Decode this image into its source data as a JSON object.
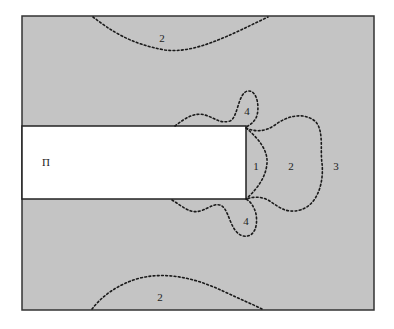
{
  "diagram": {
    "type": "zone-contour-map",
    "colors": {
      "background": "#ffffff",
      "field_fill": "#c4c4c4",
      "frame_stroke": "#333333",
      "excavation_fill": "#ffffff",
      "contour_stroke": "#1a1a1a",
      "label_color": "#222222"
    },
    "frame": {
      "x": 22,
      "y": 16,
      "width": 352,
      "height": 294
    },
    "excavation": {
      "label": "П",
      "x": 22,
      "y": 126,
      "width": 224,
      "height": 73,
      "label_pos": {
        "x": 46,
        "y": 166
      }
    },
    "zones": [
      {
        "id": "zone-2-top",
        "label": "2",
        "label_pos": {
          "x": 162,
          "y": 42
        },
        "path": "M93,17 C110,30 130,44 165,50 C195,54 230,35 268,17"
      },
      {
        "id": "zone-4-upper",
        "label": "4",
        "label_pos": {
          "x": 247,
          "y": 115
        },
        "path": "M175,126 C185,118 195,112 205,115 C215,118 220,124 230,121 C238,118 238,92 248,91 C258,90 260,110 256,118 C253,123 250,125 246,127"
      },
      {
        "id": "zone-1",
        "label": "1",
        "label_pos": {
          "x": 256,
          "y": 170
        },
        "path": "M246,128 C258,138 268,150 267,163 C266,178 256,190 246,199"
      },
      {
        "id": "zone-2-right",
        "label": "2",
        "label_pos": {
          "x": 291,
          "y": 170
        },
        "path": "M246,128 C255,132 265,132 275,125 C288,115 305,112 316,122 C324,132 320,150 322,163 C324,182 318,205 300,210 C285,214 278,206 268,200 C260,196 252,197 246,199"
      },
      {
        "id": "zone-4-lower",
        "label": "4",
        "label_pos": {
          "x": 246,
          "y": 225
        },
        "path": "M172,200 C182,206 190,214 200,211 C210,208 215,202 222,206 C230,212 230,232 243,236 C255,238 258,225 256,214 C254,206 250,201 246,199"
      },
      {
        "id": "zone-2-bottom",
        "label": "2",
        "label_pos": {
          "x": 160,
          "y": 301
        },
        "path": "M92,309 C102,296 118,284 140,278 C170,271 200,280 225,292 C240,299 252,304 262,309"
      }
    ],
    "outer_zone": {
      "id": "zone-3",
      "label": "3",
      "label_pos": {
        "x": 336,
        "y": 170
      }
    }
  }
}
